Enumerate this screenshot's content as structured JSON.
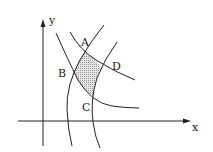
{
  "diagram": {
    "axes": {
      "x_label": "x",
      "y_label": "y"
    },
    "points": [
      {
        "id": "A",
        "label": "A"
      },
      {
        "id": "B",
        "label": "B"
      },
      {
        "id": "C",
        "label": "C"
      },
      {
        "id": "D",
        "label": "D"
      }
    ],
    "region": {
      "description": "shaded curvilinear quadrilateral ABCD",
      "fill": "#bdbdbd"
    },
    "colors": {
      "stroke": "#222222",
      "background": "#ffffff"
    }
  }
}
